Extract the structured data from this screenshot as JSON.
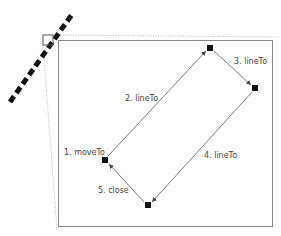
{
  "diagram": {
    "steps": [
      {
        "label": "1. moveTo"
      },
      {
        "label": "2. lineTo"
      },
      {
        "label": "3. lineTo"
      },
      {
        "label": "4. lineTo"
      },
      {
        "label": "5. close"
      }
    ],
    "colors": {
      "line": "#555555",
      "point": "#111111",
      "frame": "#888888",
      "dotted": "#bbbbbb",
      "dashed": "#111111"
    }
  }
}
